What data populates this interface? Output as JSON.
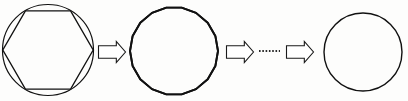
{
  "figure": {
    "background_color": "#fdfdfc",
    "ink_color": "#111111",
    "width": 408,
    "height": 101,
    "steps": [
      {
        "id": "step-1",
        "label": "circle with inscribed hexagon",
        "shape_kind": "circle-with-inscribed-polygon",
        "polygon_sides": 6,
        "center": [
          48,
          50
        ],
        "radius": 46,
        "stroke_width": 1.2
      },
      {
        "id": "step-2",
        "label": "inscribed polygon with many sides",
        "shape_kind": "polygon",
        "polygon_sides": 18,
        "center": [
          174,
          51
        ],
        "radius": 44,
        "stroke_width": 1.9
      },
      {
        "id": "step-3",
        "label": "limiting circle",
        "shape_kind": "circle",
        "polygon_sides": 0,
        "center": [
          363,
          52
        ],
        "radius": 39,
        "stroke_width": 1.4
      }
    ],
    "arrows": [
      {
        "id": "arrow-1",
        "label": "implies",
        "x": 98,
        "y": 41,
        "width": 27,
        "height": 21
      },
      {
        "id": "arrow-2",
        "label": "implies",
        "x": 226,
        "y": 41,
        "width": 27,
        "height": 21
      },
      {
        "id": "arrow-3",
        "label": "implies",
        "x": 286,
        "y": 41,
        "width": 27,
        "height": 21
      }
    ],
    "ellipsis": {
      "id": "continuation-dots",
      "label": "continues",
      "x1": 259,
      "x2": 280,
      "y": 51,
      "dot_count": 6
    }
  }
}
